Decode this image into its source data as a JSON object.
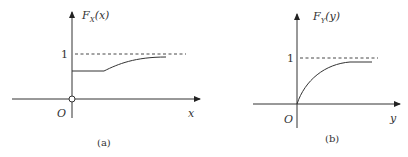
{
  "panels": [
    {
      "id": "a",
      "caption": "(a)",
      "ylabel": {
        "main": "F",
        "sub": "X",
        "arg": "(x)"
      },
      "xlabel": "x",
      "origin_label": "O",
      "one_label": "1",
      "description": "CDF with a jump (open circle) at origin: constant level below 1, then rising smoothly toward asymptote 1",
      "open_circle_at_origin": true
    },
    {
      "id": "b",
      "caption": "(b)",
      "ylabel": {
        "main": "F",
        "sub": "Y",
        "arg": "(y)"
      },
      "xlabel": "y",
      "origin_label": "O",
      "one_label": "1",
      "description": "Continuous CDF starting at origin, concave increase approaching asymptote 1",
      "open_circle_at_origin": false
    }
  ]
}
